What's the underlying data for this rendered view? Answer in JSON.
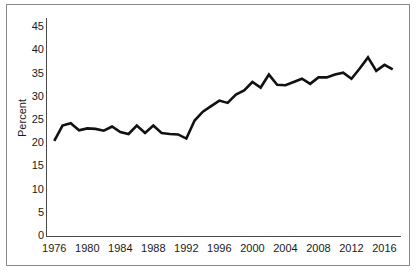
{
  "chart_data": {
    "type": "line",
    "title": "",
    "subtitle": "",
    "xlabel": "",
    "ylabel": "Percent",
    "ylim": [
      0,
      47
    ],
    "xlim": [
      1975,
      2018
    ],
    "grid": false,
    "legend": null,
    "legend_position": "none",
    "y_ticks": [
      0,
      5,
      10,
      15,
      20,
      25,
      30,
      35,
      40,
      45
    ],
    "y_tick_labels": [
      "0",
      "5",
      "10",
      "15",
      "20",
      "25",
      "30",
      "35",
      "40",
      "45"
    ],
    "x_ticks": [
      1976,
      1980,
      1984,
      1988,
      1992,
      1996,
      2000,
      2004,
      2008,
      2012,
      2016
    ],
    "x_tick_labels": [
      "1976",
      "1980",
      "1984",
      "1988",
      "1992",
      "1996",
      "2000",
      "2004",
      "2008",
      "2012",
      "2016"
    ],
    "line_color": "#111111",
    "line_width": 2.6,
    "x": [
      1976,
      1977,
      1978,
      1979,
      1980,
      1981,
      1982,
      1983,
      1984,
      1985,
      1986,
      1987,
      1988,
      1989,
      1990,
      1991,
      1992,
      1993,
      1994,
      1995,
      1996,
      1997,
      1998,
      1999,
      2000,
      2001,
      2002,
      2003,
      2004,
      2005,
      2006,
      2007,
      2008,
      2009,
      2010,
      2011,
      2012,
      2013,
      2014,
      2015,
      2016,
      2017
    ],
    "values": [
      20.5,
      23.8,
      24.3,
      22.8,
      23.2,
      23.1,
      22.7,
      23.6,
      22.4,
      22.0,
      23.8,
      22.2,
      23.8,
      22.2,
      22.0,
      21.9,
      21.0,
      24.9,
      26.8,
      28.0,
      29.2,
      28.7,
      30.5,
      31.4,
      33.2,
      32.0,
      34.8,
      32.6,
      32.5,
      33.2,
      33.9,
      32.8,
      34.2,
      34.2,
      34.8,
      35.2,
      33.9,
      36.1,
      38.5,
      35.6,
      36.9,
      35.9
    ],
    "series": [
      {
        "name": "Percent",
        "values": [
          20.5,
          23.8,
          24.3,
          22.8,
          23.2,
          23.1,
          22.7,
          23.6,
          22.4,
          22.0,
          23.8,
          22.2,
          23.8,
          22.2,
          22.0,
          21.9,
          21.0,
          24.9,
          26.8,
          28.0,
          29.2,
          28.7,
          30.5,
          31.4,
          33.2,
          32.0,
          34.8,
          32.6,
          32.5,
          33.2,
          33.9,
          32.8,
          34.2,
          34.2,
          34.8,
          35.2,
          33.9,
          36.1,
          38.5,
          35.6,
          36.9,
          35.9
        ]
      }
    ]
  },
  "axes": {
    "y_label": "Percent"
  }
}
